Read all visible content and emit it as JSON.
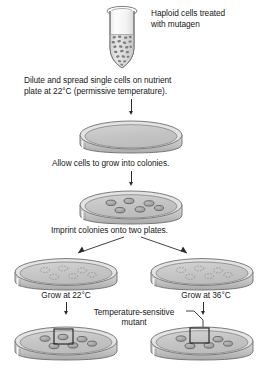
{
  "figure": {
    "background": "#ffffff",
    "ink": "#1a1a1a"
  },
  "steps": [
    {
      "id": "step-1",
      "label_line1": "Haploid cells treated",
      "label_line2": "with mutagen",
      "icon": "microcentrifuge-tube"
    },
    {
      "id": "step-2",
      "label_line1": "Dilute and spread single cells on nutrient",
      "label_line2": "plate at 22°C (permissive temperature).",
      "icon": "petri-dish-empty"
    },
    {
      "id": "step-3",
      "label_line1": "Allow cells to grow into colonies.",
      "label_line2": "",
      "icon": "petri-dish-colonies"
    },
    {
      "id": "step-4",
      "label_line1": "Imprint colonies onto two plates.",
      "label_line2": "",
      "icon": "petri-dish-two-branch"
    }
  ],
  "branches": {
    "left": {
      "imprint_label": "",
      "grow_label": "Grow at 22°C",
      "temperature": "22°C",
      "result": "all colonies grow",
      "colonies": 6,
      "highlight_box": true,
      "highlight_has_colony": true
    },
    "right": {
      "imprint_label": "",
      "grow_label": "Grow at 36°C",
      "temperature": "36°C",
      "result": "one colony missing",
      "colonies": 6,
      "highlight_box": true,
      "highlight_has_colony": false
    }
  },
  "annotation": {
    "line1": "Temperature-sensitive",
    "line2": "mutant",
    "leader": "pointer-to-right-plate-box"
  },
  "colors": {
    "plate_fill": "#c9c9c9",
    "plate_fill_light": "#d8d8d8",
    "plate_rim": "#b0b0b0",
    "colony_fill": "#a8a8a8",
    "stroke": "#6b6b6b",
    "ink": "#1a1a1a",
    "tube_cell": "#8d8d8d"
  },
  "colony_layout": {
    "rows": [
      {
        "count": 3,
        "note": "back row"
      },
      {
        "count": 3,
        "note": "front row"
      }
    ]
  }
}
